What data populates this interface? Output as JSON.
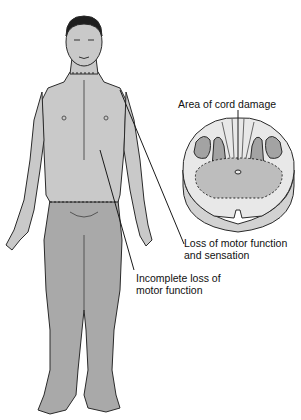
{
  "diagram": {
    "type": "medical-illustration",
    "labels": {
      "cord_damage": "Area of cord damage",
      "loss_motor_sensation_line1": "Loss of motor function",
      "loss_motor_sensation_line2": "and sensation",
      "incomplete_loss_line1": "Incomplete loss of",
      "incomplete_loss_line2": "motor function"
    },
    "colors": {
      "upper_body": "#c9c9c9",
      "lower_body": "#a9a9a9",
      "outline": "#2a2a2a",
      "cord_white_matter": "#e8e8e8",
      "cord_gray_matter": "#a3a3a3",
      "cord_damage_area": "#bdbdbd",
      "cord_side": "#d2d2d2"
    }
  }
}
